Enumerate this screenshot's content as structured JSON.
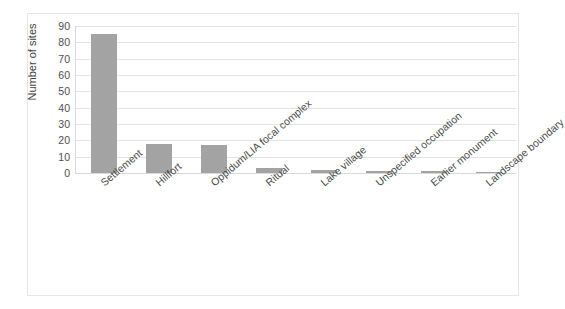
{
  "figure": {
    "caption_remnant": "",
    "background_color": "#ffffff",
    "frame_color": "#e6e6e6"
  },
  "chart_data": {
    "type": "bar",
    "title": "",
    "subtitle": "",
    "xlabel": "",
    "ylabel": "Number of sites",
    "ylim": [
      0,
      90
    ],
    "ytick_step": 10,
    "yticks": [
      "90",
      "80",
      "70",
      "60",
      "50",
      "40",
      "30",
      "20",
      "10",
      "0"
    ],
    "ytick_values": [
      90,
      80,
      70,
      60,
      50,
      40,
      30,
      20,
      10,
      0
    ],
    "grid": true,
    "grid_axis": "y",
    "legend": false,
    "legend_position": "none",
    "bar_color": "#a3a3a3",
    "gridline_color": "#e3e3e3",
    "categories": [
      "Settlement",
      "Hillfort",
      "Oppidum/LIA focal complex",
      "Ritual",
      "Lake village",
      "Unspecified occupation",
      "Earlier monument",
      "Landscape boundary"
    ],
    "values": [
      85,
      18,
      17,
      3,
      2,
      1,
      1,
      0.5
    ],
    "annotations": []
  }
}
